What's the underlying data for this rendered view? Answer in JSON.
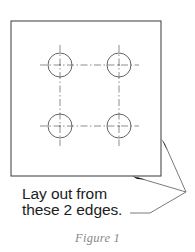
{
  "figure": {
    "caption_label": "Figure",
    "caption_number": "1",
    "annotation_line_1": "Lay out from",
    "annotation_line_2": "these 2 edges.",
    "annotation_full": "Lay out from these 2 edges."
  },
  "colors": {
    "background": "#ffffff",
    "outline": "#4a4a4a",
    "circle": "#555555",
    "centerline": "#777777",
    "leader": "#6b6b6b",
    "arrowhead": "#111111",
    "text": "#1c1c1c",
    "caption": "#8a8a8a"
  },
  "drawing": {
    "plate": {
      "name": "workpiece-plate",
      "left": 11,
      "top": 21,
      "right": 161,
      "bottom": 176,
      "width": 150,
      "height": 155
    },
    "holes": [
      {
        "id": "hole-top-left",
        "cx": 60,
        "cy": 65,
        "r": 12
      },
      {
        "id": "hole-top-right",
        "cx": 119,
        "cy": 65,
        "r": 12
      },
      {
        "id": "hole-bottom-left",
        "cx": 60,
        "cy": 126,
        "r": 12
      },
      {
        "id": "hole-bottom-right",
        "cx": 119,
        "cy": 126,
        "r": 12
      }
    ],
    "hole_count": 4,
    "rows": 2,
    "columns": 2,
    "leaders": [
      {
        "id": "leader-right-edge",
        "target_x": 162,
        "target_y": 140
      },
      {
        "id": "leader-bottom-edge",
        "target_x": 133,
        "target_y": 176
      }
    ],
    "leader_vertex": {
      "x": 186,
      "y": 192
    },
    "leader_text_anchor": {
      "x": 131,
      "y": 213
    },
    "referenced_edge_count": 2
  }
}
